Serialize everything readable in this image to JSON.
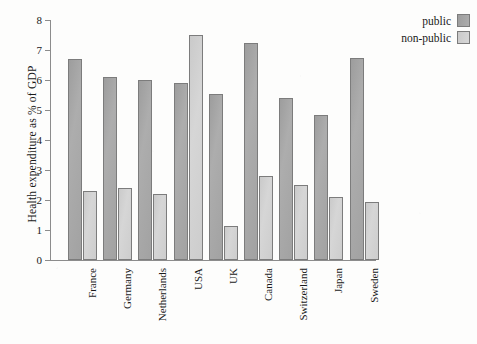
{
  "chart_data": {
    "type": "bar",
    "title": "",
    "xlabel": "",
    "ylabel": "Health expenditure as % of GDP",
    "ylim": [
      0,
      8
    ],
    "yticks": [
      0,
      1,
      2,
      3,
      4,
      5,
      6,
      7,
      8
    ],
    "grid": false,
    "legend_position": "top-right",
    "categories": [
      "France",
      "Germany",
      "Netherlands",
      "USA",
      "UK",
      "Canada",
      "Switzerland",
      "Japan",
      "Sweden"
    ],
    "series": [
      {
        "name": "public",
        "color": "#a6a6a6",
        "values": [
          6.7,
          6.1,
          6.0,
          5.9,
          5.55,
          7.25,
          5.4,
          4.85,
          6.75
        ]
      },
      {
        "name": "non-public",
        "color": "#d2d2d2",
        "values": [
          2.3,
          2.4,
          2.2,
          7.5,
          1.15,
          2.8,
          2.5,
          2.1,
          1.95
        ]
      }
    ]
  },
  "legend": {
    "items": [
      {
        "label": "public",
        "swatch": "public"
      },
      {
        "label": "non-public",
        "swatch": "nonpublic"
      }
    ]
  },
  "axes": {
    "y_title": "Health expenditure as % of GDP"
  }
}
